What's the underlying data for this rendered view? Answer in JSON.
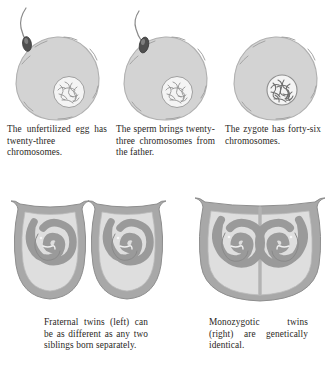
{
  "figure": {
    "background_color": "#ffffff",
    "text_color": "#2a2724"
  },
  "palette": {
    "egg_fill": "#d3d3d3",
    "egg_outline": "#a9a9a9",
    "nucleus_fill": "#f2f2f2",
    "nucleus_outline": "#9a9a9a",
    "chromosome_stroke": "#8f8f8f",
    "sperm_head": "#4a4a4a",
    "sperm_tail": "#7d7d7d",
    "womb_wall": "#a8a8a8",
    "womb_inner": "#dcdcdc",
    "fetus_fill": "#9e9e9e",
    "fetus_outline": "#8a8a8a",
    "membrane": "#b5b5b5"
  },
  "top_row": {
    "panels": [
      {
        "id": "unfertilized-egg",
        "icon": "egg-cell-icon",
        "has_sperm": true,
        "sperm_position": "outside",
        "nucleus_label": "twenty-three chromosomes",
        "caption": "The unfertilized egg has twenty-three chromosomes."
      },
      {
        "id": "sperm-entering-egg",
        "icon": "egg-cell-icon",
        "has_sperm": true,
        "sperm_position": "penetrating",
        "nucleus_label": "twenty-three chromosomes",
        "caption": "The sperm brings twenty-three chromosomes from the father."
      },
      {
        "id": "zygote",
        "icon": "egg-cell-icon",
        "has_sperm": false,
        "sperm_position": "none",
        "nucleus_label": "forty-six chromosomes",
        "caption": "The zygote has forty-six chromosomes."
      }
    ]
  },
  "bottom_row": {
    "panels": [
      {
        "id": "fraternal-twins",
        "icon": "uterus-twins-icon",
        "sacs": 2,
        "shared_sac": false,
        "caption": "Fraternal twins (left) can be as different as any two siblings born separately."
      },
      {
        "id": "monozygotic-twins",
        "icon": "uterus-twins-icon",
        "sacs": 1,
        "shared_sac": true,
        "caption": "Monozygotic twins (right) are genetically identical."
      }
    ]
  }
}
